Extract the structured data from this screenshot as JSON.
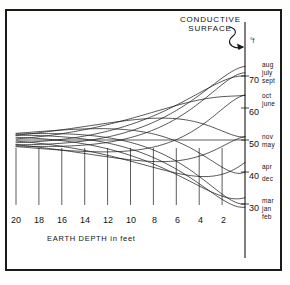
{
  "figure": {
    "callout_label": "CONDUCTIVE\nSURFACE",
    "callout_line1": "CONDUCTIVE",
    "callout_line2": "SURFACE",
    "unit_label": "°f",
    "xaxis_title": "EARTH DEPTH in feet"
  },
  "chart_data": {
    "type": "line",
    "title": "",
    "subtitle": "",
    "xlabel": "EARTH DEPTH in feet",
    "ylabel": "°f",
    "xlim": [
      20,
      0
    ],
    "ylim": [
      25,
      78
    ],
    "x_ticks": [
      20,
      18,
      16,
      14,
      12,
      10,
      8,
      6,
      4,
      2
    ],
    "y_ticks": [
      70,
      60,
      50,
      40,
      30
    ],
    "grid": false,
    "legend_position": "right-axis-inline",
    "mean_temperature": 50,
    "surface_amplitude": 22,
    "damping_depth_ft": 8.5,
    "x": [
      20,
      19,
      18,
      17,
      16,
      15,
      14,
      13,
      12,
      11,
      10,
      9,
      8,
      7,
      6,
      5,
      4,
      3,
      2,
      1,
      0
    ],
    "series": [
      {
        "name": "aug",
        "phase_months": 0.0,
        "surface_value": 73,
        "label_side": "right"
      },
      {
        "name": "july",
        "phase_months": -0.6,
        "surface_value": 71,
        "label_side": "right"
      },
      {
        "name": "sept",
        "phase_months": 0.7,
        "surface_value": 70,
        "label_side": "right"
      },
      {
        "name": "oct",
        "phase_months": 1.8,
        "surface_value": 64,
        "label_side": "right"
      },
      {
        "name": "june",
        "phase_months": -1.8,
        "surface_value": 64,
        "label_side": "right"
      },
      {
        "name": "nov",
        "phase_months": 3.0,
        "surface_value": 51,
        "label_side": "right"
      },
      {
        "name": "may",
        "phase_months": -3.0,
        "surface_value": 51,
        "label_side": "right"
      },
      {
        "name": "apr",
        "phase_months": -4.2,
        "surface_value": 43,
        "label_side": "right"
      },
      {
        "name": "dec",
        "phase_months": 4.3,
        "surface_value": 40,
        "label_side": "right"
      },
      {
        "name": "mar",
        "phase_months": -5.3,
        "surface_value": 32,
        "label_side": "right"
      },
      {
        "name": "jan",
        "phase_months": 5.4,
        "surface_value": 30,
        "label_side": "right"
      },
      {
        "name": "feb",
        "phase_months": 6.0,
        "surface_value": 29,
        "label_side": "right"
      }
    ],
    "right_axis_groups": [
      {
        "value": 70,
        "months": [
          "aug",
          "july",
          "sept"
        ],
        "tick_label": "70"
      },
      {
        "value": 64,
        "months": [
          "oct",
          "june"
        ],
        "tick_label": ""
      },
      {
        "value": 60,
        "months": [],
        "tick_label": "60"
      },
      {
        "value": 50,
        "months": [
          "nov",
          "may"
        ],
        "tick_label": "50"
      },
      {
        "value": 44,
        "months": [
          "apr"
        ],
        "tick_label": ""
      },
      {
        "value": 40,
        "months": [
          "dec"
        ],
        "tick_label": "40"
      },
      {
        "value": 30,
        "months": [
          "mar",
          "jan",
          "feb"
        ],
        "tick_label": "30"
      }
    ]
  },
  "y_axis_labels": [
    {
      "id": "y70",
      "text": "70",
      "top": 76
    },
    {
      "id": "y60",
      "text": "60",
      "top": 108
    },
    {
      "id": "y50",
      "text": "50",
      "top": 140
    },
    {
      "id": "y40",
      "text": "40",
      "top": 172
    },
    {
      "id": "y30",
      "text": "30",
      "top": 204
    }
  ],
  "month_labels": [
    {
      "id": "aug",
      "text": "aug",
      "top": 62,
      "left": 262
    },
    {
      "id": "july",
      "text": "july",
      "top": 70,
      "left": 262
    },
    {
      "id": "sept",
      "text": "sept",
      "top": 78,
      "left": 262
    },
    {
      "id": "oct",
      "text": "oct",
      "top": 93,
      "left": 262
    },
    {
      "id": "june",
      "text": "june",
      "top": 101,
      "left": 262
    },
    {
      "id": "nov",
      "text": "nov",
      "top": 134,
      "left": 262
    },
    {
      "id": "may",
      "text": "may",
      "top": 142,
      "left": 262
    },
    {
      "id": "apr",
      "text": "apr",
      "top": 164,
      "left": 262
    },
    {
      "id": "dec",
      "text": "dec",
      "top": 176,
      "left": 262
    },
    {
      "id": "mar",
      "text": "mar",
      "top": 198,
      "left": 262
    },
    {
      "id": "jan",
      "text": "jan",
      "top": 206,
      "left": 262
    },
    {
      "id": "feb",
      "text": "feb",
      "top": 214,
      "left": 262
    }
  ],
  "x_axis_labels": [
    {
      "id": "x20",
      "text": "20",
      "left": 11
    },
    {
      "id": "x18",
      "text": "18",
      "left": 34
    },
    {
      "id": "x16",
      "text": "16",
      "left": 57
    },
    {
      "id": "x14",
      "text": "14",
      "left": 80
    },
    {
      "id": "x12",
      "text": "12",
      "left": 103
    },
    {
      "id": "x10",
      "text": "10",
      "left": 126
    },
    {
      "id": "x8",
      "text": "8",
      "left": 152
    },
    {
      "id": "x6",
      "text": "6",
      "left": 175
    },
    {
      "id": "x4",
      "text": "4",
      "left": 198
    },
    {
      "id": "x2",
      "text": "2",
      "left": 221
    }
  ]
}
